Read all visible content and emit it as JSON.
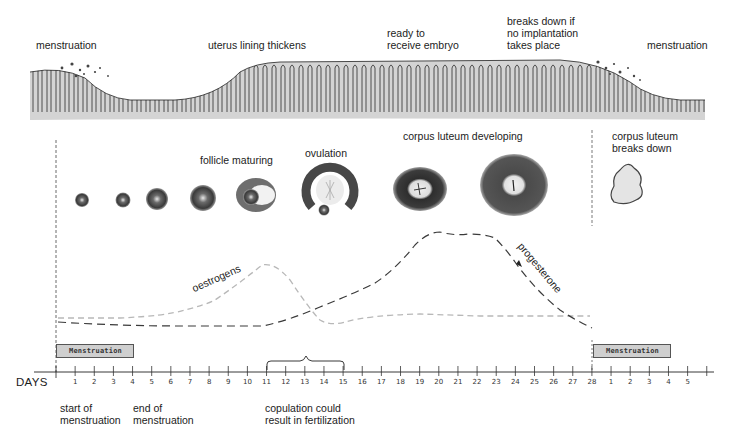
{
  "labels": {
    "uterus_top": [
      {
        "id": "menstruation-left",
        "text": "menstruation",
        "x": 36,
        "y": 39
      },
      {
        "id": "uterus-lining-thickens",
        "text": "uterus lining thickens",
        "x": 208,
        "y": 39
      },
      {
        "id": "ready-to-receive-embryo",
        "text": "ready to\nreceive embryo",
        "x": 387,
        "y": 27
      },
      {
        "id": "breaks-down-if-no-implantation",
        "text": "breaks down if\nno implantation\ntakes place",
        "x": 507,
        "y": 15
      },
      {
        "id": "menstruation-right",
        "text": "menstruation",
        "x": 647,
        "y": 39
      }
    ],
    "ovary_row": [
      {
        "id": "follicle-maturing",
        "text": "follicle maturing",
        "x": 200,
        "y": 154
      },
      {
        "id": "ovulation",
        "text": "ovulation",
        "x": 305,
        "y": 147
      },
      {
        "id": "corpus-luteum-developing",
        "text": "corpus luteum developing",
        "x": 403,
        "y": 130
      },
      {
        "id": "corpus-luteum-breaks-down",
        "text": "corpus luteum\nbreaks down",
        "x": 612,
        "y": 130
      }
    ],
    "hormones": {
      "oestrogens": "oestrogens",
      "progesterone": "progesterone"
    },
    "bottom": [
      {
        "id": "start-of-menstruation",
        "text": "start of\nmenstruation",
        "x": 60,
        "y": 402
      },
      {
        "id": "end-of-menstruation",
        "text": "end of\nmenstruation",
        "x": 133,
        "y": 402
      },
      {
        "id": "copulation-fertilization",
        "text": "copulation could\nresult in fertilization",
        "x": 265,
        "y": 402
      }
    ]
  },
  "menstruation_bars": [
    {
      "id": "menstruation-bar-1",
      "text": "Menstruation",
      "x": 56,
      "y": 344,
      "w": 78
    },
    {
      "id": "menstruation-bar-2",
      "text": "Menstruation",
      "x": 593,
      "y": 344,
      "w": 78
    }
  ],
  "axis": {
    "label": "DAYS",
    "ticks": [
      "1",
      "2",
      "3",
      "4",
      "5",
      "6",
      "7",
      "8",
      "9",
      "10",
      "11",
      "12",
      "13",
      "14",
      "15",
      "16",
      "17",
      "18",
      "19",
      "20",
      "21",
      "22",
      "23",
      "24",
      "25",
      "26",
      "27",
      "28",
      "1",
      "2",
      "3",
      "4",
      "5"
    ],
    "origin_x": 56,
    "day_px": 19.14
  },
  "fertile_window": {
    "from_day": 11,
    "to_day": 15
  },
  "colors": {
    "ink": "#1c1c1c",
    "tissue": "#d4d4d4",
    "oestrogen_line": "#b8b8b8",
    "progesterone_line": "#3a3a3a",
    "bar_fill": "#cfcfcf"
  },
  "chart_data": {
    "type": "line",
    "xlabel": "DAYS",
    "ylabel": "relative hormone level",
    "x": [
      0,
      2,
      4,
      6,
      7,
      8,
      9,
      10,
      11,
      12,
      13,
      14,
      15,
      16,
      18,
      19,
      20,
      21,
      22,
      23,
      24,
      25,
      26,
      27,
      28
    ],
    "series": [
      {
        "name": "oestrogens",
        "values": [
          10,
          10,
          11,
          15,
          22,
          28,
          38,
          60,
          62,
          50,
          25,
          5,
          8,
          9,
          10,
          10,
          10,
          10,
          9,
          9,
          9,
          8,
          8,
          8,
          8
        ]
      },
      {
        "name": "progesterone",
        "values": [
          5,
          4,
          3,
          3,
          2,
          2,
          2,
          2,
          2,
          6,
          12,
          20,
          28,
          35,
          52,
          72,
          95,
          93,
          93,
          88,
          70,
          48,
          30,
          15,
          3
        ]
      }
    ],
    "annotations": [
      "follicle maturing",
      "ovulation",
      "corpus luteum developing",
      "corpus luteum breaks down",
      "copulation could result in fertilization (days 11-15)"
    ],
    "grid": false,
    "legend": "inline labels"
  }
}
